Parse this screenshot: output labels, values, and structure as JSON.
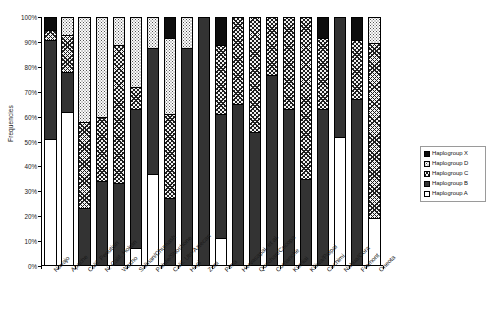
{
  "chart_data": {
    "type": "bar",
    "stacked": true,
    "normalized_percent": true,
    "title": "",
    "xlabel": "",
    "ylabel": "Frequencies",
    "ylim": [
      0,
      100
    ],
    "ytick_labels": [
      "100%",
      "90%",
      "80%",
      "70%",
      "60%",
      "50%",
      "40%",
      "30%",
      "20%",
      "10%",
      "0%"
    ],
    "ytick_values": [
      100,
      90,
      80,
      70,
      60,
      50,
      40,
      30,
      20,
      10,
      0
    ],
    "grid": false,
    "legend_position": "right",
    "legend_order_top_to_bottom": [
      "Haplogroup X",
      "Haplogroup D",
      "Haplogroup C",
      "Haplogroup B",
      "Haplogroup A"
    ],
    "categories": [
      "Navajo",
      "Apache",
      "Calif. Penutian",
      "N. Calif. Hokan",
      "Washo",
      "Salinan/Chumash",
      "Paiute/Shoshone",
      "Calif. Uto-Aztecan",
      "Hopi",
      "Zuni",
      "Pima",
      "Hervasapai, et al.",
      "Quechan/Cocopa",
      "Comanche",
      "Kumiai",
      "Kiliwa/Paipai",
      "Cochimi",
      "Nahua/Cora",
      "Fremont",
      "Oneota"
    ],
    "series": [
      {
        "name": "Haplogroup A",
        "pattern": "white",
        "values": [
          51,
          62,
          0,
          0,
          0,
          7,
          37,
          0,
          0,
          0,
          11,
          0,
          0,
          0,
          0,
          0,
          0,
          52,
          0,
          19
        ]
      },
      {
        "name": "Haplogroup B",
        "pattern": "solid-dark",
        "values": [
          40,
          16,
          23,
          34,
          33,
          56,
          51,
          27,
          88,
          100,
          50,
          65,
          54,
          77,
          63,
          35,
          63,
          48,
          67,
          0
        ]
      },
      {
        "name": "Haplogroup C",
        "pattern": "cross-hatch",
        "values": [
          4,
          15,
          35,
          26,
          56,
          9,
          0,
          34,
          0,
          0,
          28,
          35,
          46,
          23,
          37,
          65,
          29,
          0,
          24,
          71
        ]
      },
      {
        "name": "Haplogroup D",
        "pattern": "light-dotted",
        "values": [
          0,
          7,
          42,
          40,
          11,
          28,
          12,
          31,
          12,
          0,
          0,
          0,
          0,
          0,
          0,
          0,
          0,
          0,
          0,
          10
        ]
      },
      {
        "name": "Haplogroup X",
        "pattern": "solid-black",
        "values": [
          5,
          0,
          0,
          0,
          0,
          0,
          0,
          8,
          0,
          0,
          11,
          0,
          0,
          0,
          0,
          0,
          8,
          0,
          9,
          0
        ]
      }
    ]
  },
  "legend": {
    "items": [
      {
        "label": "Haplogroup X",
        "pattern_class": "p-X"
      },
      {
        "label": "Haplogroup D",
        "pattern_class": "p-D"
      },
      {
        "label": "Haplogroup C",
        "pattern_class": "p-C"
      },
      {
        "label": "Haplogroup B",
        "pattern_class": "p-B"
      },
      {
        "label": "Haplogroup A",
        "pattern_class": "p-A"
      }
    ]
  },
  "axes": {
    "y_title": "Frequencies"
  }
}
